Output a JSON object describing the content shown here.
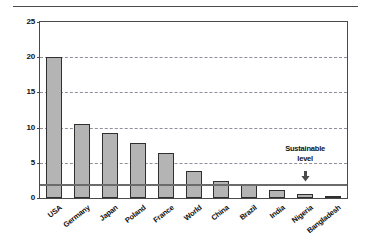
{
  "chart_data": {
    "type": "bar",
    "title": "",
    "subtitle": "",
    "xlabel": "",
    "ylabel": "",
    "ylim": [
      0,
      25
    ],
    "yticks": [
      0,
      5,
      10,
      15,
      20,
      25
    ],
    "grid": true,
    "grid_style": "dashed horizontal",
    "legend": "none",
    "categories": [
      "USA",
      "Germany",
      "Japan",
      "Poland",
      "France",
      "World",
      "China",
      "Brazil",
      "India",
      "Nigeria",
      "Bangladesh"
    ],
    "values": [
      20.0,
      10.5,
      9.3,
      7.8,
      6.4,
      3.9,
      2.4,
      1.9,
      1.1,
      0.6,
      0.3
    ],
    "series": [
      {
        "name": "",
        "values": [
          20.0,
          10.5,
          9.3,
          7.8,
          6.4,
          3.9,
          2.4,
          1.9,
          1.1,
          0.6,
          0.3
        ]
      }
    ],
    "annotations": [
      {
        "name": "sustainable-level",
        "text_line1": "Sustainable",
        "text_line2": "level",
        "value": 2.0,
        "marker": "down-arrow",
        "attached_to_category": "Nigeria"
      }
    ],
    "reference_lines": [
      {
        "name": "sustainable-level-line",
        "value": 2.0,
        "style": "solid",
        "color": "#6b6b6b"
      }
    ],
    "colors": {
      "bar_fill": "#b4b4b4",
      "bar_stroke": "#2f2f2f",
      "grid": "#8f8f9c",
      "axis": "#4a4a4a",
      "text": "#111111",
      "background": "#ffffff"
    }
  }
}
